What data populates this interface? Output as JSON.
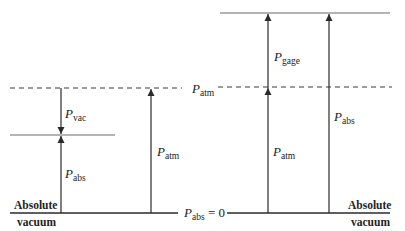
{
  "diagram": {
    "title": "",
    "colors": {
      "line": "#2a2a2a",
      "dashed": "#3a3a3a",
      "gray_line": "#6a6a6a"
    },
    "labels": {
      "p_vac": {
        "base": "P",
        "sub": "vac"
      },
      "p_abs_left": {
        "base": "P",
        "sub": "abs"
      },
      "p_atm_left": {
        "base": "P",
        "sub": "atm"
      },
      "p_atm_center": {
        "base": "P",
        "sub": "atm"
      },
      "p_gage": {
        "base": "P",
        "sub": "gage"
      },
      "p_atm_right": {
        "base": "P",
        "sub": "atm"
      },
      "p_abs_right": {
        "base": "P",
        "sub": "abs"
      },
      "p_abs_zero": {
        "base": "P",
        "sub": "abs",
        "suffix": " = 0"
      }
    },
    "absolute_vacuum_left": {
      "line1": "Absolute",
      "line2": "vacuum"
    },
    "absolute_vacuum_right": {
      "line1": "Absolute",
      "line2": "vacuum"
    }
  }
}
